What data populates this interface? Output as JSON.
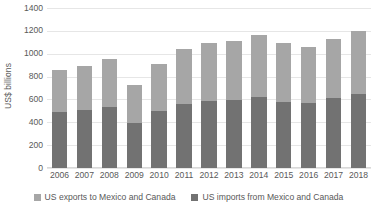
{
  "chart_data": {
    "type": "bar",
    "subtype": "stacked-bar",
    "title": "",
    "xlabel": "",
    "ylabel": "US$ billions",
    "ylim": [
      0,
      1400
    ],
    "ytick_step": 200,
    "yticks": [
      "1400",
      "1200",
      "1000",
      "800",
      "600",
      "400",
      "200",
      "0"
    ],
    "grid": true,
    "legend_position": "bottom",
    "categories": [
      "2006",
      "2007",
      "2008",
      "2009",
      "2010",
      "2011",
      "2012",
      "2013",
      "2014",
      "2015",
      "2016",
      "2017",
      "2018"
    ],
    "series": [
      {
        "name": "US imports from Mexico and Canada",
        "color": "#727272",
        "stack_order": 0,
        "values": [
          490,
          510,
          530,
          390,
          500,
          560,
          590,
          595,
          625,
          580,
          570,
          610,
          645
        ]
      },
      {
        "name": "US exports to Mexico and Canada",
        "color": "#a6a6a6",
        "stack_order": 1,
        "values": [
          370,
          385,
          425,
          340,
          410,
          485,
          505,
          515,
          535,
          510,
          485,
          515,
          555
        ]
      }
    ],
    "totals": [
      860,
      895,
      955,
      730,
      910,
      1045,
      1095,
      1110,
      1160,
      1090,
      1055,
      1125,
      1200
    ]
  },
  "legend": {
    "items": [
      {
        "label": "US exports to Mexico and Canada",
        "color": "#a6a6a6",
        "icon": "square-swatch-icon"
      },
      {
        "label": "US imports from Mexico and Canada",
        "color": "#727272",
        "icon": "square-swatch-icon"
      }
    ]
  },
  "colors": {
    "exports": "#a6a6a6",
    "imports": "#727272",
    "gridline": "#e6e6e6",
    "text": "#595959",
    "background": "#ffffff"
  }
}
